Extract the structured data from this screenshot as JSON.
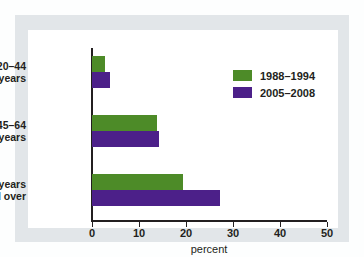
{
  "chart_data": {
    "type": "bar",
    "orientation": "horizontal",
    "title": "",
    "subtitle": "",
    "xlabel": "percent",
    "ylabel": "",
    "categories": [
      "20–44 years",
      "45–64 years",
      "65 years and over"
    ],
    "category_lines": [
      [
        "20–44",
        "years"
      ],
      [
        "45–64",
        "years"
      ],
      [
        "65 years",
        "and over"
      ]
    ],
    "series": [
      {
        "name": "1988–1994",
        "color": "#4d8b28",
        "values": [
          2.8,
          13.8,
          19.4
        ]
      },
      {
        "name": "2005–2008",
        "color": "#4c2089",
        "values": [
          3.8,
          14.3,
          27.2
        ]
      }
    ],
    "xlim": [
      0,
      50
    ],
    "xticks": [
      0,
      10,
      20,
      30,
      40,
      50
    ],
    "xtick_labels": [
      "0",
      "10",
      "20",
      "30",
      "40",
      "50"
    ],
    "grid": false,
    "legend_position": "top-right"
  },
  "figure": {
    "background_color": "#fdfefe",
    "panel_color": "#e2e6e9",
    "plot_color": "#ffffff",
    "axis_color": "#231f20"
  }
}
